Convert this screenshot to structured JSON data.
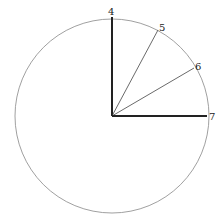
{
  "diagram": {
    "type": "circle-with-radii",
    "labels": {
      "r4": "4",
      "r5": "5",
      "r6": "6",
      "r7": "7"
    }
  }
}
